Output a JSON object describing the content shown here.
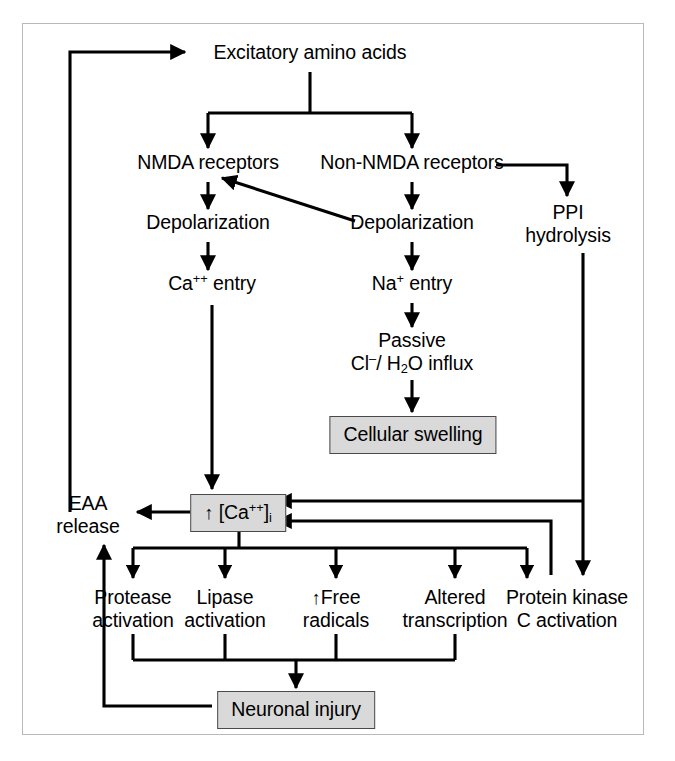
{
  "diagram": {
    "frame_color": "#b9b9b9",
    "line_color": "#000000",
    "box_fill": "#d9d9d9",
    "box_border": "#4a4a4a",
    "nodes": {
      "excitatory": "Excitatory amino acids",
      "nmda": "NMDA receptors",
      "non_nmda": "Non-NMDA receptors",
      "depol_left": "Depolarization",
      "depol_right": "Depolarization",
      "ppi_line1": "PPI",
      "ppi_line2": "hydrolysis",
      "ca_entry_pre": "Ca",
      "ca_entry_sup": "++",
      "ca_entry_post": " entry",
      "na_entry_pre": "Na",
      "na_entry_sup": "+",
      "na_entry_post": " entry",
      "passive_line1": "Passive",
      "passive_cl": "Cl",
      "passive_cl_sup": "–",
      "passive_mid": "/ H",
      "passive_h_sub": "2",
      "passive_end": "O influx",
      "cellular_swelling": "Cellular swelling",
      "eaa_line1": "EAA",
      "eaa_line2": "release",
      "ca_i_arrow": "↑",
      "ca_i_pre": " [Ca",
      "ca_i_sup": "++",
      "ca_i_mid": "]",
      "ca_i_sub": "i",
      "protease_line1": "Protease",
      "protease_line2": "activation",
      "lipase_line1": "Lipase",
      "lipase_line2": "activation",
      "free_rad_arrow": "↑",
      "free_rad_line1": "Free",
      "free_rad_line2": "radicals",
      "altered_line1": "Altered",
      "altered_line2": "transcription",
      "pkc_line1": "Protein kinase",
      "pkc_line2": "C activation",
      "neuronal_injury": "Neuronal injury"
    }
  }
}
